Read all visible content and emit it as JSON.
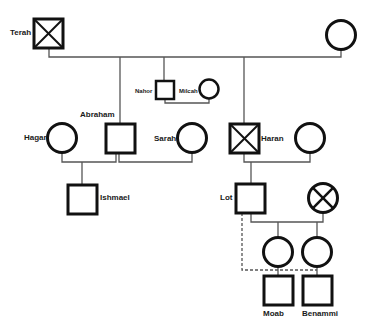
{
  "diagram": {
    "type": "pedigree-chart",
    "colors": {
      "line": "#555555",
      "symbol_stroke": "#111111",
      "background": "#ffffff",
      "text": "#1a1a1a"
    },
    "people": [
      {
        "id": "terah",
        "name": "Terah",
        "sex": "male",
        "deceased": true
      },
      {
        "id": "terah_wife",
        "name": "",
        "sex": "female",
        "deceased": false
      },
      {
        "id": "abraham",
        "name": "Abraham",
        "sex": "male",
        "deceased": false
      },
      {
        "id": "nahor",
        "name": "Nahor",
        "sex": "male",
        "deceased": false
      },
      {
        "id": "milcah",
        "name": "Milcah",
        "sex": "female",
        "deceased": false
      },
      {
        "id": "haran",
        "name": "Haran",
        "sex": "male",
        "deceased": true
      },
      {
        "id": "hagar",
        "name": "Hagar",
        "sex": "female",
        "deceased": false
      },
      {
        "id": "sarah",
        "name": "Sarah",
        "sex": "female",
        "deceased": false
      },
      {
        "id": "haran_wife",
        "name": "",
        "sex": "female",
        "deceased": false
      },
      {
        "id": "ishmael",
        "name": "Ishmael",
        "sex": "male",
        "deceased": false
      },
      {
        "id": "lot",
        "name": "Lot",
        "sex": "male",
        "deceased": false
      },
      {
        "id": "lot_wife",
        "name": "",
        "sex": "female",
        "deceased": true
      },
      {
        "id": "daughter1",
        "name": "",
        "sex": "female",
        "deceased": false
      },
      {
        "id": "daughter2",
        "name": "",
        "sex": "female",
        "deceased": false
      },
      {
        "id": "moab",
        "name": "Moab",
        "sex": "male",
        "deceased": false
      },
      {
        "id": "benammi",
        "name": "Benammi",
        "sex": "male",
        "deceased": false
      }
    ],
    "labels": {
      "terah": "Terah",
      "abraham": "Abraham",
      "nahor": "Nahor",
      "milcah": "Milcah",
      "haran": "Haran",
      "hagar": "Hagar",
      "sarah": "Sarah",
      "ishmael": "Ishmael",
      "lot": "Lot",
      "moab": "Moab",
      "benammi": "Benammi"
    },
    "relationships": [
      {
        "type": "union",
        "partners": [
          "terah",
          "terah_wife"
        ],
        "children": [
          "abraham",
          "nahor",
          "haran"
        ]
      },
      {
        "type": "union",
        "partners": [
          "nahor",
          "milcah"
        ],
        "children": []
      },
      {
        "type": "union",
        "partners": [
          "hagar",
          "abraham"
        ],
        "children": [
          "ishmael"
        ]
      },
      {
        "type": "union",
        "partners": [
          "abraham",
          "sarah"
        ],
        "children": []
      },
      {
        "type": "union",
        "partners": [
          "haran",
          "haran_wife"
        ],
        "children": [
          "lot"
        ]
      },
      {
        "type": "union",
        "partners": [
          "lot",
          "lot_wife"
        ],
        "children": [
          "daughter1",
          "daughter2"
        ]
      },
      {
        "type": "consanguineous-dashed",
        "partners": [
          "lot",
          "daughter1"
        ],
        "children": [
          "moab"
        ]
      },
      {
        "type": "consanguineous-dashed",
        "partners": [
          "lot",
          "daughter2"
        ],
        "children": [
          "benammi"
        ]
      }
    ]
  }
}
